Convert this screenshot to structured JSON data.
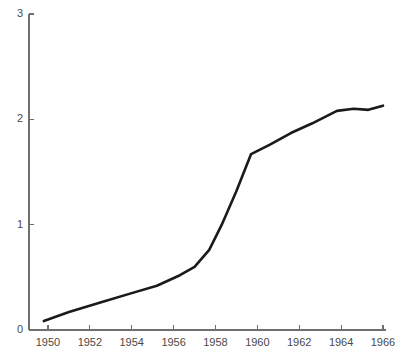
{
  "chart_data": {
    "type": "line",
    "title": "",
    "subtitle": "",
    "xlabel": "",
    "ylabel": "",
    "xlim": [
      1949.75,
      1966.25
    ],
    "ylim": [
      0,
      3
    ],
    "grid": false,
    "legend": false,
    "legend_position": "none",
    "x_ticks": [
      1950,
      1952,
      1954,
      1956,
      1958,
      1960,
      1962,
      1964,
      1966
    ],
    "x_tick_labels": [
      "1950",
      "1952",
      "1954",
      "1956",
      "1958",
      "1960",
      "1962",
      "1964",
      "1966"
    ],
    "y_ticks": [
      0,
      1,
      2,
      3
    ],
    "y_tick_labels": [
      "0",
      "1",
      "2",
      "3"
    ],
    "series": [
      {
        "name": "series-1",
        "color": "#1a1a1a",
        "x": [
          1949.8,
          1951.0,
          1952.5,
          1954.0,
          1955.2,
          1956.3,
          1957.0,
          1957.7,
          1958.3,
          1959.0,
          1959.7,
          1960.6,
          1961.6,
          1962.6,
          1963.8,
          1964.6,
          1965.3,
          1966.0
        ],
        "y": [
          0.085,
          0.17,
          0.26,
          0.35,
          0.42,
          0.52,
          0.6,
          0.76,
          1.0,
          1.32,
          1.67,
          1.76,
          1.87,
          1.96,
          2.08,
          2.1,
          2.09,
          2.13
        ]
      }
    ],
    "annotations": []
  },
  "axes": {
    "axis_color": "#6f6f6f",
    "tick_color": "#6f6f6f",
    "label_color": "#4a4a4a"
  },
  "figure": {
    "background": "#ffffff",
    "width": 403,
    "height": 360
  }
}
